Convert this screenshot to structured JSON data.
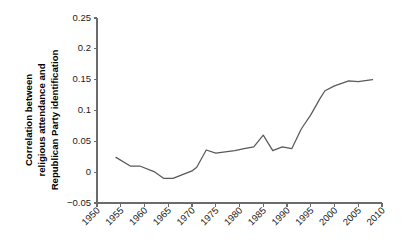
{
  "chart_data": {
    "type": "line",
    "title": "",
    "xlabel": "",
    "ylabel": "Correlation between religious attendance and Republican Party identification",
    "ylabel_lines": [
      "Correlation between",
      "religious attendance and",
      "Republican Party identification"
    ],
    "xlim": [
      1950,
      2010
    ],
    "ylim": [
      -0.05,
      0.25
    ],
    "xticks": [
      1950,
      1955,
      1960,
      1965,
      1970,
      1975,
      1980,
      1985,
      1990,
      1995,
      2000,
      2005,
      2010
    ],
    "xtick_labels": [
      "1950",
      "1955",
      "1960",
      "1965",
      "1970",
      "1975",
      "1980",
      "1985",
      "1990",
      "1995",
      "2000",
      "2005",
      "2010"
    ],
    "yticks": [
      -0.05,
      0,
      0.05,
      0.1,
      0.15,
      0.2,
      0.25
    ],
    "ytick_labels": [
      "−0.05",
      "0",
      "0.05",
      "0.1",
      "0.15",
      "0.2",
      "0.25"
    ],
    "grid": false,
    "legend": "none",
    "line_color": "#595959",
    "series": [
      {
        "name": "Correlation between religious attendance and Republican Party identification",
        "x": [
          1954,
          1957,
          1959,
          1962,
          1964,
          1966,
          1968,
          1970,
          1971,
          1973,
          1975,
          1977,
          1979,
          1981,
          1983,
          1985,
          1987,
          1989,
          1991,
          1993,
          1995,
          1997,
          1998,
          2000,
          2003,
          2005,
          2008
        ],
        "values": [
          0.024,
          0.01,
          0.01,
          0.001,
          -0.01,
          -0.01,
          -0.004,
          0.002,
          0.008,
          0.036,
          0.031,
          0.033,
          0.035,
          0.038,
          0.041,
          0.06,
          0.035,
          0.041,
          0.038,
          0.07,
          0.093,
          0.12,
          0.132,
          0.14,
          0.148,
          0.147,
          0.15
        ]
      }
    ]
  },
  "figure": {
    "plot_left": 97,
    "plot_right": 382,
    "plot_top": 18,
    "plot_bottom": 203
  }
}
